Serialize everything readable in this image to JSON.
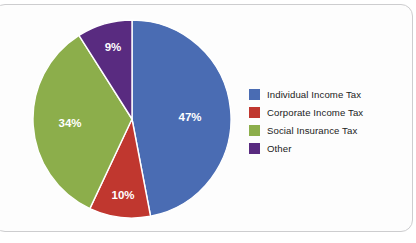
{
  "chart_data": {
    "type": "pie",
    "title": "",
    "subtitle": "",
    "xlabel": "",
    "ylabel": "",
    "legend_position": "right",
    "grid": false,
    "start_angle_deg": 0,
    "direction": "clockwise",
    "categories": [
      "Individual Income Tax",
      "Corporate Income Tax",
      "Social Insurance Tax",
      "Other"
    ],
    "values": [
      47,
      10,
      34,
      9
    ],
    "value_unit": "%",
    "data_labels": [
      "47%",
      "10%",
      "34%",
      "9%"
    ],
    "colors": [
      "#4a6cb3",
      "#c0372f",
      "#8cae4b",
      "#592b80"
    ],
    "slices": [
      {
        "label": "Individual Income Tax",
        "value": 47,
        "data_label": "47%",
        "color": "#4a6cb3",
        "start_angle_deg": 0,
        "end_angle_deg": 169.2,
        "label_pos": {
          "x": 190,
          "y": 118
        }
      },
      {
        "label": "Corporate Income Tax",
        "value": 10,
        "data_label": "10%",
        "color": "#c0372f",
        "start_angle_deg": 169.2,
        "end_angle_deg": 205.2,
        "label_pos": {
          "x": 123,
          "y": 196
        }
      },
      {
        "label": "Social Insurance Tax",
        "value": 34,
        "data_label": "34%",
        "color": "#8cae4b",
        "start_angle_deg": 205.2,
        "end_angle_deg": 327.6,
        "label_pos": {
          "x": 70,
          "y": 124
        }
      },
      {
        "label": "Other",
        "value": 9,
        "data_label": "9%",
        "color": "#592b80",
        "start_angle_deg": 327.6,
        "end_angle_deg": 360,
        "label_pos": {
          "x": 113,
          "y": 48
        }
      }
    ]
  },
  "legend": {
    "items": [
      {
        "label": "Individual Income Tax",
        "color": "#4a6cb3",
        "swatch_name": "legend-swatch-individual-income-tax"
      },
      {
        "label": "Corporate Income Tax",
        "color": "#c0372f",
        "swatch_name": "legend-swatch-corporate-income-tax"
      },
      {
        "label": "Social Insurance Tax",
        "color": "#8cae4b",
        "swatch_name": "legend-swatch-social-insurance-tax"
      },
      {
        "label": "Other",
        "color": "#592b80",
        "swatch_name": "legend-swatch-other"
      }
    ]
  },
  "pie_geometry": {
    "center_x": 100,
    "center_y": 100,
    "radius": 99,
    "separator_color": "#ffffff",
    "separator_width": 1.4
  }
}
